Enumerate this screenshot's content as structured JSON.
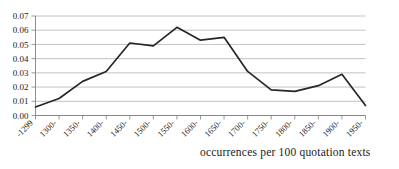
{
  "caption": "occurrences per 100 quotation texts",
  "chart_data": {
    "type": "line",
    "title": "",
    "xlabel": "",
    "ylabel": "",
    "categories": [
      "-1299",
      "1300-",
      "1350-",
      "1400-",
      "1450-",
      "1500-",
      "1550-",
      "1600-",
      "1650-",
      "1700-",
      "1750-",
      "1800-",
      "1850-",
      "1900-",
      "1950-"
    ],
    "values": [
      0.006,
      0.012,
      0.024,
      0.031,
      0.051,
      0.049,
      0.062,
      0.053,
      0.055,
      0.031,
      0.018,
      0.017,
      0.021,
      0.029,
      0.007
    ],
    "ylim": [
      0.0,
      0.07
    ],
    "ytick_labels": [
      "0.00",
      "0.01",
      "0.02",
      "0.03",
      "0.04",
      "0.05",
      "0.06",
      "0.07"
    ],
    "ytick_values": [
      0.0,
      0.01,
      0.02,
      0.03,
      0.04,
      0.05,
      0.06,
      0.07
    ],
    "grid": true,
    "legend": null,
    "line_color": "#262626",
    "grid_color": "#b3b3b3",
    "axis_color": "#808080"
  }
}
